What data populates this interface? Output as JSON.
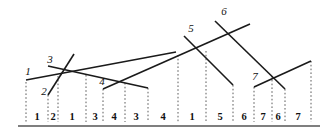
{
  "figure": {
    "title": "",
    "background_color": "#ffffff",
    "line_color": "#1a1a1a",
    "drop_line_color": "#4a4a4a",
    "axis_color": "#555555",
    "width": 331,
    "height": 132
  },
  "chart_data": {
    "type": "line",
    "title": "",
    "xlabel": "",
    "ylabel": "",
    "grid": false,
    "legend": "none",
    "xlim": [
      0,
      331
    ],
    "ylim": [
      132,
      0
    ],
    "segments": [
      {
        "id": 1,
        "label": "1",
        "x1": 26,
        "y1": 80,
        "x2": 176,
        "y2": 52,
        "label_x": 28,
        "label_y": 75
      },
      {
        "id": 2,
        "label": "2",
        "x1": 48,
        "y1": 95,
        "x2": 74,
        "y2": 54,
        "label_x": 44,
        "label_y": 95
      },
      {
        "id": 3,
        "label": "3",
        "x1": 48,
        "y1": 66,
        "x2": 148,
        "y2": 88,
        "label_x": 50,
        "label_y": 63
      },
      {
        "id": 4,
        "label": "4",
        "x1": 103,
        "y1": 89,
        "x2": 250,
        "y2": 24,
        "label_x": 102,
        "label_y": 85
      },
      {
        "id": 5,
        "label": "5",
        "x1": 184,
        "y1": 36,
        "x2": 233,
        "y2": 85,
        "label_x": 191,
        "label_y": 32
      },
      {
        "id": 6,
        "label": "6",
        "x1": 215,
        "y1": 21,
        "x2": 285,
        "y2": 89,
        "label_x": 224,
        "label_y": 15
      },
      {
        "id": 7,
        "label": "7",
        "x1": 254,
        "y1": 87,
        "x2": 311,
        "y2": 61,
        "label_x": 255,
        "label_y": 80
      }
    ],
    "drop_lines": [
      {
        "x": 26,
        "y_top": 82,
        "y_bottom": 122
      },
      {
        "x": 48,
        "y_top": 95,
        "y_bottom": 122
      },
      {
        "x": 58,
        "y_top": 76,
        "y_bottom": 122
      },
      {
        "x": 86,
        "y_top": 75,
        "y_bottom": 122
      },
      {
        "x": 103,
        "y_top": 89,
        "y_bottom": 122
      },
      {
        "x": 125,
        "y_top": 83,
        "y_bottom": 122
      },
      {
        "x": 148,
        "y_top": 88,
        "y_bottom": 122
      },
      {
        "x": 178,
        "y_top": 55,
        "y_bottom": 122
      },
      {
        "x": 206,
        "y_top": 51,
        "y_bottom": 122
      },
      {
        "x": 233,
        "y_top": 85,
        "y_bottom": 122
      },
      {
        "x": 254,
        "y_top": 87,
        "y_bottom": 122
      },
      {
        "x": 272,
        "y_top": 76,
        "y_bottom": 122
      },
      {
        "x": 285,
        "y_top": 89,
        "y_bottom": 122
      },
      {
        "x": 311,
        "y_top": 61,
        "y_bottom": 122
      }
    ],
    "axis": {
      "x1": 18,
      "x2": 320,
      "y": 126
    },
    "interval_labels": [
      {
        "text": "1",
        "x": 37,
        "y": 120
      },
      {
        "text": "2",
        "x": 53,
        "y": 120
      },
      {
        "text": "1",
        "x": 72,
        "y": 120
      },
      {
        "text": "3",
        "x": 95,
        "y": 120
      },
      {
        "text": "4",
        "x": 114,
        "y": 120
      },
      {
        "text": "3",
        "x": 136,
        "y": 120
      },
      {
        "text": "4",
        "x": 163,
        "y": 120
      },
      {
        "text": "1",
        "x": 192,
        "y": 120
      },
      {
        "text": "5",
        "x": 220,
        "y": 120
      },
      {
        "text": "6",
        "x": 244,
        "y": 120
      },
      {
        "text": "7",
        "x": 263,
        "y": 120
      },
      {
        "text": "6",
        "x": 278,
        "y": 120
      },
      {
        "text": "7",
        "x": 298,
        "y": 120
      }
    ]
  }
}
